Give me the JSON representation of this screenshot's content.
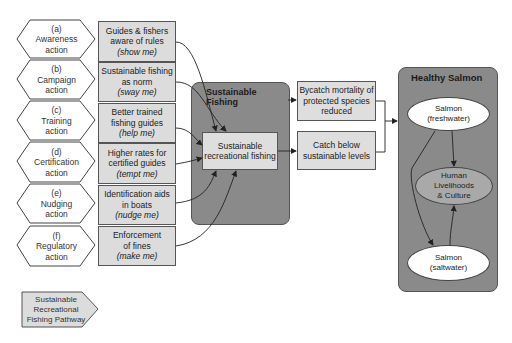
{
  "actions": [
    {
      "letter": "(a)",
      "name": "Awareness",
      "suffix": "action"
    },
    {
      "letter": "(b)",
      "name": "Campaign",
      "suffix": "action"
    },
    {
      "letter": "(c)",
      "name": "Training",
      "suffix": "action"
    },
    {
      "letter": "(d)",
      "name": "Certification",
      "suffix": "action"
    },
    {
      "letter": "(e)",
      "name": "Nudging",
      "suffix": "action"
    },
    {
      "letter": "(f)",
      "name": "Regulatory",
      "suffix": "action"
    }
  ],
  "outcomes": [
    {
      "line1": "Guides & fishers",
      "line2": "aware of rules",
      "tag": "(show me)"
    },
    {
      "line1": "Sustainable fishing",
      "line2": "as norm",
      "tag": "(sway me)"
    },
    {
      "line1": "Better trained",
      "line2": "fishing guides",
      "tag": "(help me)"
    },
    {
      "line1": "Higher rates for",
      "line2": "certified guides",
      "tag": "(tempt me)"
    },
    {
      "line1": "Identification aids",
      "line2": "in boats",
      "tag": "(nudge me)"
    },
    {
      "line1": "Enforcement",
      "line2": "of fines",
      "tag": "(make me)"
    }
  ],
  "sustainable_fishing": {
    "title": "Sustainable Fishing",
    "center_line1": "Sustainable",
    "center_line2": "recreational fishing"
  },
  "results": [
    {
      "line1": "Bycatch mortality of",
      "line2": "protected species",
      "line3": "reduced"
    },
    {
      "line1": "Catch below",
      "line2": "sustainable levels"
    }
  ],
  "healthy_salmon": {
    "title": "Healthy Salmon",
    "freshwater": {
      "line1": "Salmon",
      "line2": "(freshwater)"
    },
    "livelihoods": {
      "line1": "Human",
      "line2": "Livelihoods",
      "line3": "& Culture"
    },
    "saltwater": {
      "line1": "Salmon",
      "line2": "(saltwater)"
    }
  },
  "legend": {
    "line1": "Sustainable",
    "line2": "Recreational",
    "line3": "Fishing Pathway"
  },
  "colors": {
    "panel": "#8a8a8a",
    "box": "#dcdcdc",
    "livelihoods": "#a9a9a9",
    "line": "#222222"
  }
}
